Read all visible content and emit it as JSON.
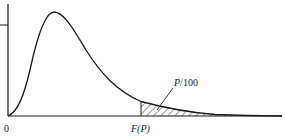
{
  "diagram": {
    "type": "probability-density-curve",
    "labels": {
      "origin": "0",
      "threshold": "F(P)",
      "tail_area": "P/100"
    },
    "colors": {
      "stroke": "#1a1a1a",
      "background": "#ffffff"
    }
  }
}
